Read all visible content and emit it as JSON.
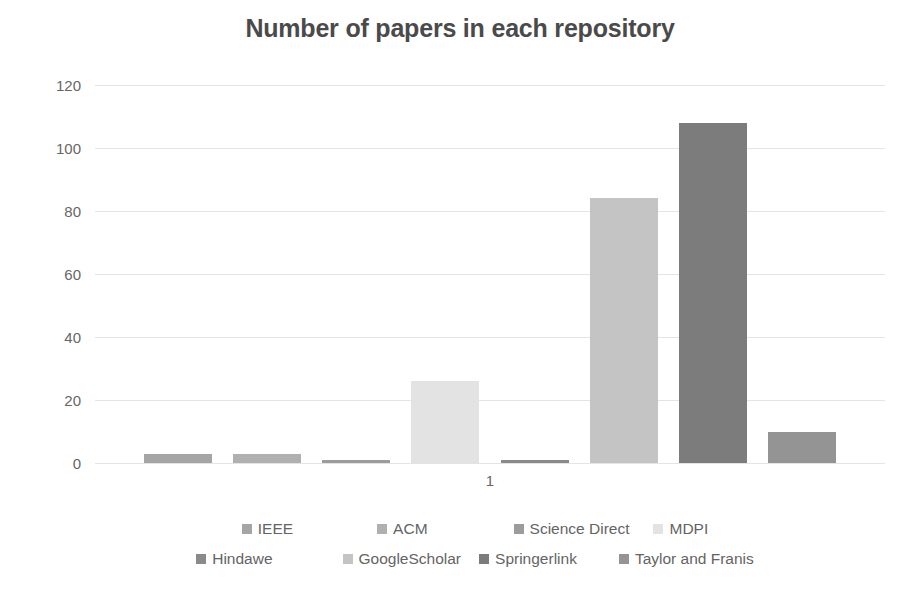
{
  "chart_data": {
    "type": "bar",
    "title": "Number of papers in each repository",
    "xlabel": "",
    "ylabel": "",
    "categories": [
      "1"
    ],
    "ylim": [
      0,
      120
    ],
    "yticks": [
      0,
      20,
      40,
      60,
      80,
      100,
      120
    ],
    "ytick_labels": [
      "0",
      "20",
      "40",
      "60",
      "80",
      "100",
      "120"
    ],
    "grid": true,
    "legend_position": "bottom",
    "series": [
      {
        "name": "IEEE",
        "values": [
          3
        ],
        "color": "#a5a5a5"
      },
      {
        "name": "ACM",
        "values": [
          3
        ],
        "color": "#b0b0b0"
      },
      {
        "name": "Science Direct",
        "values": [
          1
        ],
        "color": "#9c9c9c"
      },
      {
        "name": "MDPI",
        "values": [
          26
        ],
        "color": "#e3e3e3"
      },
      {
        "name": "Hindawe",
        "values": [
          1
        ],
        "color": "#8a8a8a"
      },
      {
        "name": "GoogleScholar",
        "values": [
          84
        ],
        "color": "#c4c4c4"
      },
      {
        "name": "Springerlink",
        "values": [
          108
        ],
        "color": "#7c7c7c"
      },
      {
        "name": "Taylor and Franis",
        "values": [
          10
        ],
        "color": "#949494"
      }
    ]
  },
  "legend": {
    "rows": [
      [
        {
          "label": "IEEE",
          "color": "#a5a5a5"
        },
        {
          "label": "ACM",
          "color": "#b0b0b0"
        },
        {
          "label": "Science Direct",
          "color": "#9c9c9c"
        },
        {
          "label": "MDPI",
          "color": "#e3e3e3"
        }
      ],
      [
        {
          "label": "Hindawe",
          "color": "#8a8a8a"
        },
        {
          "label": "GoogleScholar",
          "color": "#c4c4c4"
        },
        {
          "label": "Springerlink",
          "color": "#7c7c7c"
        },
        {
          "label": "Taylor and Franis",
          "color": "#949494"
        }
      ]
    ]
  }
}
